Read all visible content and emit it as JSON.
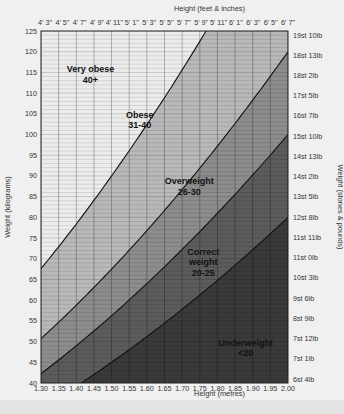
{
  "chart_data": {
    "type": "area",
    "title": "",
    "xlabel": "Height (metres)",
    "ylabel": "Weight (kilograms)",
    "x2label": "Height (feet & inches)",
    "y2label": "Weight (stones & pounds)",
    "xlim": [
      1.3,
      2.0
    ],
    "ylim": [
      40,
      125
    ],
    "grid": true,
    "x_ticks": [
      "1.30",
      "1.35",
      "1.40",
      "1.45",
      "1.50",
      "1.55",
      "1.60",
      "1.65",
      "1.70",
      "1.75",
      "1.80",
      "1.85",
      "1.90",
      "1.95",
      "2.00"
    ],
    "y_ticks": [
      40,
      45,
      50,
      55,
      60,
      65,
      70,
      75,
      80,
      85,
      90,
      95,
      100,
      105,
      110,
      115,
      120,
      125
    ],
    "x2_ticks": [
      "4' 3\"",
      "4' 5\"",
      "4' 7\"",
      "4' 9\"",
      "4' 11\"",
      "5' 1\"",
      "5' 3\"",
      "5' 5\"",
      "5' 7\"",
      "5' 9\"",
      "5' 11\"",
      "6' 1\"",
      "6' 3\"",
      "6' 5\"",
      "6' 7\""
    ],
    "y2_ticks": [
      "6st 4lb",
      "7st 1lb",
      "7st 12lb",
      "8st 9lb",
      "9st 6lb",
      "10st 3lb",
      "11st 0lb",
      "11st 11lb",
      "12st 8lb",
      "13st 5lb",
      "14st 2lb",
      "14st 13lb",
      "15st 10lb",
      "16st 7lb",
      "17st 5lb",
      "18st 2lb",
      "18st 13lb",
      "19st 10lb"
    ],
    "bmi_boundaries": [
      20,
      25,
      30,
      40
    ],
    "series": [
      {
        "name": "Underweight",
        "range": "<20",
        "label_lines": [
          "Underweight",
          "<20"
        ],
        "color": "#3a3a3a",
        "label_pos": [
          1.88,
          49
        ]
      },
      {
        "name": "Correct weight",
        "range": "20-25",
        "label_lines": [
          "Correct",
          "weight",
          "20-25"
        ],
        "color": "#5c5c5c",
        "label_pos": [
          1.76,
          71
        ]
      },
      {
        "name": "Overweight",
        "range": "26-30",
        "label_lines": [
          "Overweight",
          "26-30"
        ],
        "color": "#8d8d8d",
        "label_pos": [
          1.72,
          88
        ]
      },
      {
        "name": "Obese",
        "range": "31-40",
        "label_lines": [
          "Obese",
          "31-40"
        ],
        "color": "#b9b9b9",
        "label_pos": [
          1.58,
          104
        ]
      },
      {
        "name": "Very obese",
        "range": "40+",
        "label_lines": [
          "Very obese",
          "40+"
        ],
        "color": "#ececec",
        "label_pos": [
          1.44,
          115
        ]
      }
    ]
  }
}
